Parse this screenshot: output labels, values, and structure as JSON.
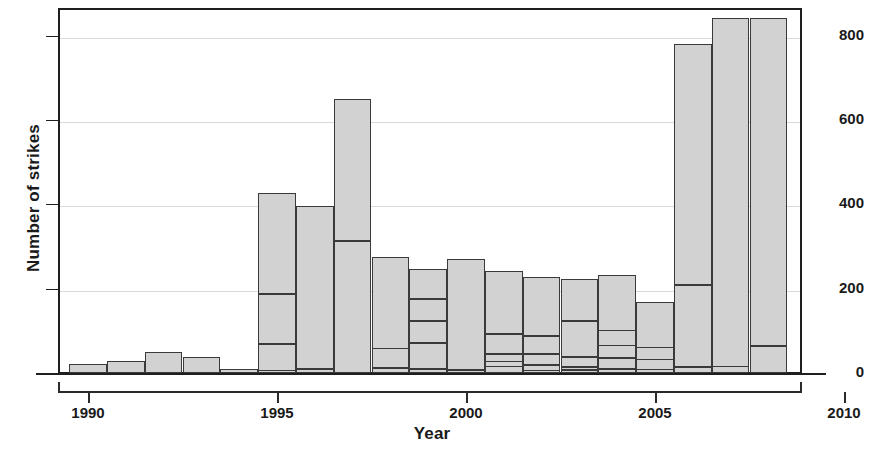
{
  "chart_data": {
    "type": "bar",
    "title": "",
    "xlabel": "Year",
    "ylabel": "Number of strikes",
    "xlim": [
      1988.6,
      2010.2
    ],
    "ylim": [
      0,
      870
    ],
    "grid": true,
    "legend": null,
    "y_ticks": [
      0,
      200,
      400,
      600,
      800
    ],
    "x_ticks": [
      1990,
      1995,
      2000,
      2005,
      2010
    ],
    "categories": [
      1990,
      1991,
      1992,
      1993,
      1994,
      1995,
      1996,
      1997,
      1998,
      1999,
      2000,
      2001,
      2002,
      2003,
      2004,
      2005,
      2006,
      2007,
      2008
    ],
    "values": [
      22,
      28,
      50,
      38,
      10,
      427,
      396,
      650,
      275,
      246,
      271,
      242,
      227,
      224,
      232,
      168,
      781,
      842,
      842
    ],
    "stack_breaks": [
      [],
      [],
      [],
      [],
      [],
      [
        8,
        71,
        190
      ],
      [
        12
      ],
      [
        316
      ],
      [
        14,
        60
      ],
      [
        12,
        73,
        125,
        178
      ],
      [
        9
      ],
      [
        18,
        30,
        47,
        95
      ],
      [
        8,
        21,
        48,
        90
      ],
      [
        9,
        16,
        41,
        126
      ],
      [
        12,
        38,
        68,
        103
      ],
      [
        11,
        34,
        63
      ],
      [
        16,
        211
      ],
      [
        18
      ],
      [
        66
      ]
    ]
  },
  "axes": {
    "y_tick_labels": [
      "0",
      "200",
      "400",
      "600",
      "800"
    ],
    "x_tick_labels": [
      "1990",
      "1995",
      "2000",
      "2005",
      "2010"
    ]
  },
  "colors": {
    "bar_fill": "#d2d2d2",
    "bar_stroke": "#3a3a3a",
    "axis": "#1f1f1f",
    "grid": "#d9d9d9",
    "text": "#1a1a1a"
  }
}
